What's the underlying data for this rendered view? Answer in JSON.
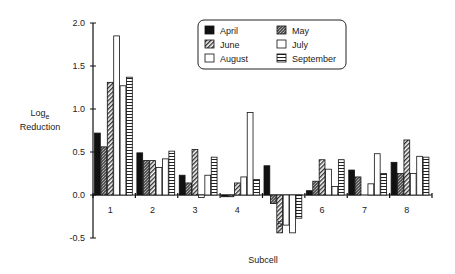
{
  "chart_data": {
    "type": "bar",
    "title": "",
    "xlabel": "Subcell",
    "ylabel": "Log_e Reduction",
    "ylabel_main": "Log",
    "ylabel_sub": "e",
    "ylabel_line2": "Reduction",
    "ylim": [
      -0.5,
      2.0
    ],
    "yticks": [
      "2.0",
      "1.5",
      "1.0",
      "0.5",
      "0.0",
      "-0.5"
    ],
    "ytick_values": [
      2.0,
      1.5,
      1.0,
      0.5,
      0.0,
      -0.5
    ],
    "categories": [
      "1",
      "2",
      "3",
      "4",
      "5",
      "6",
      "7",
      "8"
    ],
    "grid": false,
    "legend_position": "top-right (inside, boxed)",
    "series": [
      {
        "name": "April",
        "pattern": "solid-black",
        "values": [
          0.72,
          0.49,
          0.23,
          -0.02,
          0.34,
          0.05,
          0.29,
          0.38
        ]
      },
      {
        "name": "May",
        "pattern": "dark-stipple",
        "values": [
          0.56,
          0.4,
          0.14,
          -0.02,
          -0.1,
          0.16,
          0.21,
          0.25
        ]
      },
      {
        "name": "June",
        "pattern": "diagonal-hatch",
        "values": [
          1.31,
          0.4,
          0.53,
          0.14,
          -0.44,
          0.41,
          0.0,
          0.64
        ]
      },
      {
        "name": "July",
        "pattern": "white",
        "values": [
          1.85,
          0.32,
          -0.03,
          0.21,
          -0.35,
          0.3,
          0.13,
          0.25
        ]
      },
      {
        "name": "August",
        "pattern": "white",
        "values": [
          1.27,
          0.42,
          0.23,
          0.96,
          -0.44,
          0.1,
          0.48,
          0.45
        ]
      },
      {
        "name": "September",
        "pattern": "horizontal-lines",
        "values": [
          1.37,
          0.51,
          0.44,
          0.18,
          -0.27,
          0.41,
          0.25,
          0.44
        ]
      }
    ]
  },
  "legend": {
    "items": [
      {
        "label": "April",
        "pattern": "solid-black"
      },
      {
        "label": "May",
        "pattern": "dark-stipple"
      },
      {
        "label": "June",
        "pattern": "diagonal-hatch"
      },
      {
        "label": "July",
        "pattern": "white"
      },
      {
        "label": "August",
        "pattern": "white"
      },
      {
        "label": "September",
        "pattern": "horizontal-lines"
      }
    ]
  }
}
